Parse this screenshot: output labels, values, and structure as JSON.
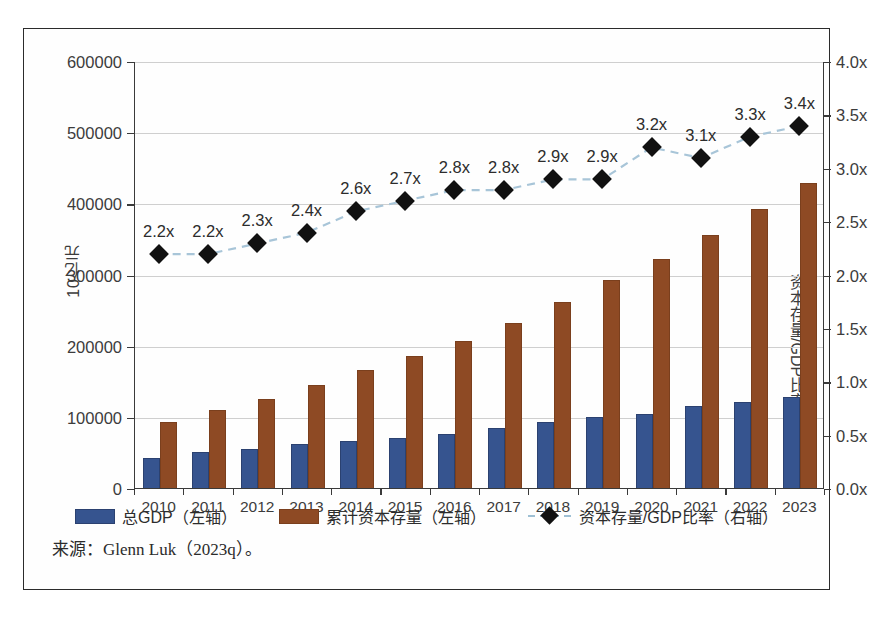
{
  "figure": {
    "source_note": "来源：Glenn Luk（2023q）。"
  },
  "legend": {
    "items": [
      {
        "label": "总GDP（左轴）",
        "marker": "blue-square-swatch",
        "color": "#36548f"
      },
      {
        "label": "累计资本存量（左轴）",
        "marker": "brown-square-swatch",
        "color": "#8e4a24"
      },
      {
        "label": "资本存量/GDP比率（右轴）",
        "marker": "black-diamond-dashed-line",
        "color": "#111111"
      }
    ]
  },
  "chart_data": {
    "type": "bar",
    "title": "",
    "subtitle": "",
    "xlabel": "",
    "ylabel": "10亿元",
    "y2label": "资本存量/GDP比率（倍数）",
    "categories": [
      "2010",
      "2011",
      "2012",
      "2013",
      "2014",
      "2015",
      "2016",
      "2017",
      "2018",
      "2019",
      "2020",
      "2021",
      "2022",
      "2023"
    ],
    "ylim": [
      0,
      600000
    ],
    "yticks": [
      "0",
      "100000",
      "200000",
      "300000",
      "400000",
      "500000",
      "600000"
    ],
    "ytick_values": [
      0,
      100000,
      200000,
      300000,
      400000,
      500000,
      600000
    ],
    "y2lim": [
      0,
      4.0
    ],
    "y2ticks": [
      "0.0x",
      "0.5x",
      "1.0x",
      "1.5x",
      "2.0x",
      "2.5x",
      "3.0x",
      "3.5x",
      "4.0x"
    ],
    "y2tick_values": [
      0,
      0.5,
      1.0,
      1.5,
      2.0,
      2.5,
      3.0,
      3.5,
      4.0
    ],
    "grid": true,
    "legend_position": "bottom",
    "series": [
      {
        "name": "总GDP（左轴）",
        "type": "bar",
        "axis": "left",
        "color": "#36548f",
        "values": [
          41000,
          49000,
          54000,
          60000,
          65000,
          69000,
          74000,
          83000,
          92000,
          99000,
          103000,
          114000,
          120000,
          126000
        ]
      },
      {
        "name": "累计资本存量（左轴）",
        "type": "bar",
        "axis": "left",
        "color": "#8e4a24",
        "values": [
          91000,
          108000,
          124000,
          143000,
          164000,
          184000,
          205000,
          231000,
          260000,
          291000,
          321000,
          354000,
          391000,
          427000
        ]
      },
      {
        "name": "资本存量/GDP比率（右轴）",
        "type": "line",
        "axis": "right",
        "color": "#111111",
        "line_color": "#a8c5d8",
        "line_style": "dashed",
        "marker": "diamond",
        "values": [
          2.2,
          2.2,
          2.3,
          2.4,
          2.6,
          2.7,
          2.8,
          2.8,
          2.9,
          2.9,
          3.2,
          3.1,
          3.3,
          3.4
        ],
        "data_labels": [
          "2.2x",
          "2.2x",
          "2.3x",
          "2.4x",
          "2.6x",
          "2.7x",
          "2.8x",
          "2.8x",
          "2.9x",
          "2.9x",
          "3.2x",
          "3.1x",
          "3.3x",
          "3.4x"
        ]
      }
    ]
  }
}
